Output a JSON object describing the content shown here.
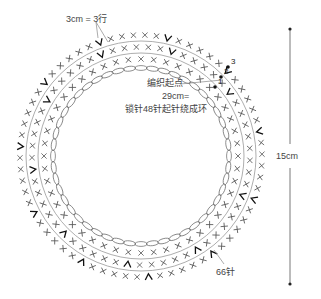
{
  "diagram": {
    "title": "",
    "ring": {
      "center": [
        141,
        156
      ],
      "chain_radius": 88,
      "row_radii": [
        97,
        109,
        121
      ],
      "guide_circle_radii": [
        103,
        115
      ],
      "stitches_per_row": [
        48,
        57,
        66
      ],
      "stitch_symbol": "X",
      "increase_symbol": "V",
      "stroke_color": "#555555",
      "chain_color": "#666666"
    },
    "labels": {
      "rows_note": "3cm = 3行",
      "start_point": "编织起点",
      "chain_length": "29cm=",
      "chain_desc": "锁针48针起针绕成环",
      "outer_count": "66针",
      "height": "15cm"
    },
    "row_markers": [
      "1",
      "2",
      "3"
    ],
    "dimension_line": {
      "x": 290,
      "y_top": 29,
      "y_bottom": 284
    }
  }
}
